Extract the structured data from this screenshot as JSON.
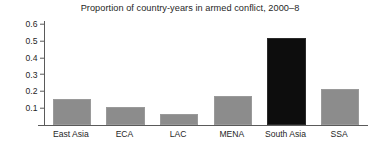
{
  "chart_data": {
    "type": "bar",
    "title": "Proportion of country-years in armed conflict, 2000–8",
    "xlabel": "",
    "ylabel": "",
    "categories": [
      "East Asia",
      "ECA",
      "LAC",
      "MENA",
      "South Asia",
      "SSA"
    ],
    "values": [
      0.145,
      0.093,
      0.052,
      0.162,
      0.505,
      0.205
    ],
    "bar_colors": [
      "#8c8c8c",
      "#8c8c8c",
      "#8c8c8c",
      "#8c8c8c",
      "#0d0d0d",
      "#8c8c8c"
    ],
    "highlighted_category": "South Asia",
    "ylim": [
      0.0,
      0.62
    ],
    "ytick_values": [
      0.1,
      0.2,
      0.3,
      0.4,
      0.5,
      0.6
    ],
    "ytick_labels": [
      "0.1",
      "0.2",
      "0.3",
      "0.4",
      "0.5",
      "0.6"
    ],
    "grid": false,
    "legend": false,
    "legend_position": "none",
    "axis_color": "#5a5a5a",
    "background": "#ffffff"
  }
}
